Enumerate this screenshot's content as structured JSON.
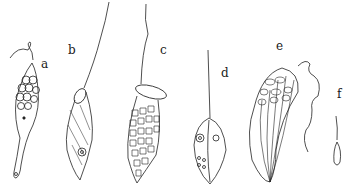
{
  "figure": {
    "labels": [
      {
        "id": "a",
        "text": "a"
      },
      {
        "id": "b",
        "text": "b"
      },
      {
        "id": "c",
        "text": "c"
      },
      {
        "id": "d",
        "text": "d"
      },
      {
        "id": "e",
        "text": "e"
      },
      {
        "id": "f",
        "text": "f"
      }
    ],
    "ink_color": "#222222",
    "background": "#ffffff"
  }
}
